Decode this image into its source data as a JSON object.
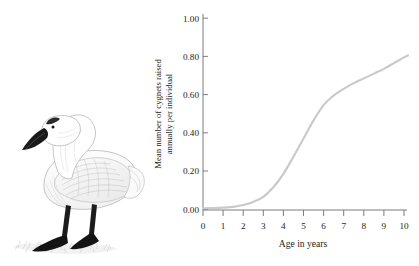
{
  "figure": {
    "illustration": {
      "name": "swan-illustration",
      "subject": "mute swan",
      "style": "pencil drawing"
    }
  },
  "chart_data": {
    "type": "line",
    "title": "",
    "xlabel": "Age in years",
    "ylabel_line1": "Mean number of cygnets raised",
    "ylabel_line2": "annually per individual",
    "xlim": [
      0,
      10
    ],
    "ylim": [
      0,
      1.0
    ],
    "grid": false,
    "legend": "none",
    "line_color": "#c9c9c9",
    "xticks": [
      "0",
      "1",
      "2",
      "3",
      "4",
      "5",
      "6",
      "7",
      "8",
      "9",
      "10"
    ],
    "yticks": [
      "0.00",
      "0.20",
      "0.40",
      "0.60",
      "0.80",
      "1.00"
    ],
    "xtick_values": [
      0,
      1,
      2,
      3,
      4,
      5,
      6,
      7,
      8,
      9,
      10
    ],
    "ytick_values": [
      0.0,
      0.2,
      0.4,
      0.6,
      0.8,
      1.0
    ],
    "series": [
      {
        "name": "Mean cygnets raised annually per individual",
        "x": [
          0,
          0.5,
          1,
          1.5,
          2,
          2.5,
          3,
          3.5,
          4,
          4.5,
          5,
          5.5,
          6,
          6.5,
          7,
          7.5,
          8,
          8.5,
          9,
          9.5,
          10,
          10.2
        ],
        "values": [
          0.005,
          0.006,
          0.008,
          0.012,
          0.022,
          0.038,
          0.065,
          0.115,
          0.185,
          0.275,
          0.37,
          0.465,
          0.545,
          0.595,
          0.63,
          0.66,
          0.685,
          0.71,
          0.735,
          0.765,
          0.795,
          0.805
        ]
      }
    ]
  }
}
